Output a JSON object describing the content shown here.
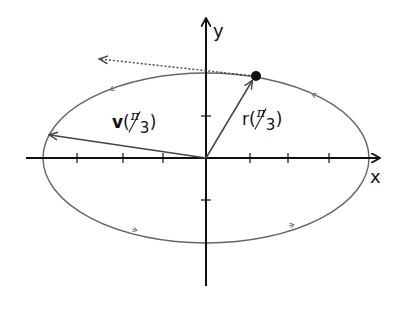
{
  "diagram": {
    "axes": {
      "x_label": "x",
      "y_label": "y"
    },
    "position_vector": {
      "name": "r",
      "arg_num": "π",
      "arg_den": "3",
      "open": "(",
      "close": ")"
    },
    "velocity_vector": {
      "name": "v",
      "arg_num": "π",
      "arg_den": "3",
      "open": "(",
      "close": ")"
    },
    "ellipse": {
      "cx": 206,
      "cy": 158,
      "rx": 163,
      "ry": 85,
      "direction": "counterclockwise"
    },
    "point": {
      "x": 256,
      "y": 76
    },
    "colors": {
      "axes": "#111111",
      "curve": "#666666",
      "vectors": "#444444"
    }
  }
}
